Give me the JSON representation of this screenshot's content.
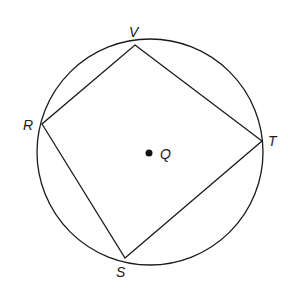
{
  "diagram": {
    "type": "inscribed-quadrilateral-in-circle",
    "circle": {
      "center_label": "Q",
      "cx": 150,
      "cy": 152,
      "r": 113
    },
    "vertices": [
      {
        "label": "V",
        "x": 135,
        "y": 45
      },
      {
        "label": "T",
        "x": 262,
        "y": 141
      },
      {
        "label": "S",
        "x": 125,
        "y": 258
      },
      {
        "label": "R",
        "x": 42,
        "y": 124
      }
    ],
    "labels": {
      "V": "V",
      "T": "T",
      "S": "S",
      "R": "R",
      "Q": "Q"
    },
    "colors": {
      "stroke": "#1a1a1a",
      "background": "#ffffff"
    }
  }
}
